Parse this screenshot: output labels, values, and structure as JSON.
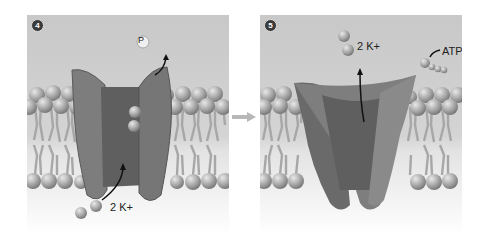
{
  "figure": {
    "panels": [
      {
        "step": "4",
        "labels": {
          "phosphate": "P",
          "ions": "2 K+"
        },
        "description": "Phosphate released; K+ ions bind from outside and move in"
      },
      {
        "step": "5",
        "labels": {
          "ions": "2 K+",
          "atp": "ATP"
        },
        "description": "ATP binds; protein returns to original shape and releases K+ inside"
      }
    ],
    "transition_arrow": "right-arrow",
    "colors": {
      "top_background": "#c9c9c9",
      "bottom_background": "#eeeeee",
      "protein": "#7c7c7c",
      "protein_dark": "#5e5e5e",
      "lipid_head": "#b5b5b5",
      "lipid_tail": "#a8a8a8",
      "ion": "#9a9a9a"
    }
  }
}
